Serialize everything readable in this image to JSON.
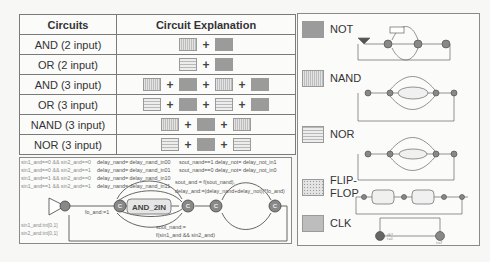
{
  "table": {
    "headers": [
      "Circuits",
      "Circuit Explanation"
    ],
    "rows": [
      {
        "name": "AND (2 input)",
        "components": [
          "AND",
          "NOT"
        ]
      },
      {
        "name": "OR (2 input)",
        "components": [
          "NOR",
          "NOT"
        ]
      },
      {
        "name": "AND (3 input)",
        "components": [
          "NAND",
          "NOT",
          "NAND",
          "NOT"
        ]
      },
      {
        "name": "OR (3 input)",
        "components": [
          "NOR",
          "NOT",
          "NOR",
          "NOT"
        ]
      },
      {
        "name": "NAND (3 input)",
        "components": [
          "NAND",
          "NOT",
          "NAND"
        ]
      },
      {
        "name": "NOR (3 input)",
        "components": [
          "NOR",
          "NOT",
          "NOR"
        ]
      }
    ],
    "plus": "+"
  },
  "legend": {
    "items": [
      {
        "label": "NOT",
        "pattern": "solid-gray"
      },
      {
        "label": "NAND",
        "pattern": "vertical-stripes"
      },
      {
        "label": "NOR",
        "pattern": "horizontal-stripes"
      },
      {
        "label": "FLIP-FLOP",
        "label_lines": [
          "FLIP-",
          "FLOP"
        ],
        "pattern": "dots"
      },
      {
        "label": "CLK",
        "pattern": "dense-dots"
      }
    ]
  },
  "automaton": {
    "guards_left": [
      "sin1_and==0 && sin2_and==0",
      "sin1_and==0 && sin2_and==1",
      "sin1_and==1 && sin2_and==0",
      "sin1_and==1 && sin2_and==1"
    ],
    "updates_nand": [
      "delay_nand= delay_nand_in00",
      "delay_nand= delay_nand_in01",
      "delay_nand= delay_nand_in10",
      "delay_nand= delay_nand_in11"
    ],
    "guards_not": [
      "sout_nand==1 delay_not= delay_not_in1",
      "sout_nand==0 delay_not= delay_not_in0"
    ],
    "select_vars": [
      "sin1_and:int[0,1]",
      "sin2_and:int[0,1]"
    ],
    "sync_label": "fo_and:=1",
    "committed_label": "C",
    "box_label": "AND_2IN",
    "sout_and": "sout_and = f(sout_nand),",
    "delay_and": "delay_and:=(delay_nand+delay_not)(*fo_and)",
    "sout_nand_1": "sout_nand:=",
    "sout_nand_2": "f(sin1_and && sin2_and)"
  },
  "clk": {
    "label_1": "clk?",
    "label_2": "t:=0",
    "label_3": "t>=T"
  }
}
